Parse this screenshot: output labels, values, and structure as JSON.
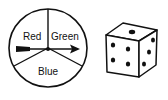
{
  "spinner": {
    "sectors": [
      {
        "label": "Red"
      },
      {
        "label": "Green"
      },
      {
        "label": "Blue"
      }
    ],
    "has_arrow": true
  },
  "die": {
    "top_face_pips": 1,
    "front_face_pips": 5,
    "right_face_pips": 3
  },
  "colors": {
    "stroke": "#111111",
    "background": "#ffffff"
  }
}
